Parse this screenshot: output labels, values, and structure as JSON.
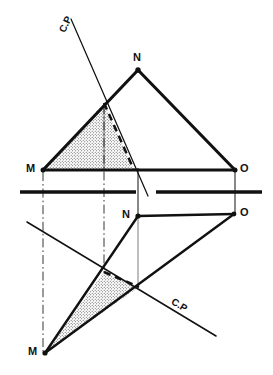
{
  "figure": {
    "type": "engineering-drawing",
    "background_color": "#ffffff",
    "line_color": "#111111",
    "stipple_color": "#4a4a4a"
  },
  "ground_line": {
    "name": "ground-line",
    "y": 192,
    "x_start": 20,
    "x_end": 262,
    "gap_start": 136,
    "gap_end": 156,
    "stroke_width": 3.2
  },
  "front_view": {
    "label": "front-view",
    "vertices": [
      {
        "name": "M",
        "label": "M",
        "x": 43,
        "y": 170,
        "label_x": 26,
        "label_y": 163,
        "dot": true
      },
      {
        "name": "N",
        "label": "N",
        "x": 138,
        "y": 70,
        "label_x": 133,
        "label_y": 52,
        "dot": true
      },
      {
        "name": "O",
        "label": "O",
        "x": 235,
        "y": 170,
        "label_x": 240,
        "label_y": 163,
        "dot": true
      }
    ],
    "edges": [
      {
        "name": "edge-MN",
        "from": "M",
        "to": "N"
      },
      {
        "name": "edge-NO",
        "from": "N",
        "to": "O"
      },
      {
        "name": "edge-MO",
        "from": "M",
        "to": "O"
      }
    ],
    "cut_line": {
      "name": "cutting-plane-line-front",
      "x1": 71,
      "y1": 19,
      "x2": 148,
      "y2": 196,
      "stroke_width": 1.2,
      "label": "C.P",
      "label_x": 62,
      "label_y": 27,
      "label_rotation": -64
    },
    "cut_intersections": [
      {
        "name": "cut-point-on-MN",
        "x": 104,
        "y": 103
      },
      {
        "name": "cut-point-on-MO",
        "x": 134,
        "y": 170
      }
    ],
    "hidden_edge": {
      "name": "hidden-cut-edge-front",
      "x1": 104,
      "y1": 103,
      "x2": 134,
      "y2": 170,
      "dash": "7,5",
      "stroke_width": 2.4
    },
    "stippled_region": {
      "name": "cut-section-front",
      "points": "43,170 104,103 134,170"
    },
    "projector_thin": {
      "name": "projector-thin-front",
      "x": 104,
      "y1": 103,
      "y2": 170
    }
  },
  "top_view": {
    "label": "top-view",
    "vertices": [
      {
        "name": "M-prime",
        "label": "M",
        "x": 45,
        "y": 353,
        "label_x": 28,
        "label_y": 346,
        "dot": true
      },
      {
        "name": "N-prime",
        "label": "N",
        "x": 138,
        "y": 216,
        "label_x": 122,
        "label_y": 209,
        "dot": true
      },
      {
        "name": "O-prime",
        "label": "O",
        "x": 234,
        "y": 214,
        "label_x": 240,
        "label_y": 207,
        "dot": true
      }
    ],
    "edges": [
      {
        "name": "edge-MN-prime",
        "from": "M-prime",
        "to": "N-prime"
      },
      {
        "name": "edge-NO-prime",
        "from": "N-prime",
        "to": "O-prime"
      },
      {
        "name": "edge-MO-prime",
        "from": "M-prime",
        "to": "O-prime"
      }
    ],
    "cut_line": {
      "name": "cutting-plane-line-top",
      "x1": 27,
      "y1": 222,
      "x2": 216,
      "y2": 336,
      "stroke_width": 1.4,
      "label": "C.P",
      "label_x": 172,
      "label_y": 296,
      "label_rotation": 31
    },
    "cut_intersections": [
      {
        "name": "cut-point-on-MN-prime",
        "x": 104,
        "y": 272
      },
      {
        "name": "cut-point-on-MO-prime",
        "x": 139,
        "y": 287
      }
    ],
    "hidden_edge": {
      "name": "hidden-cut-edge-top",
      "x1": 104,
      "y1": 272,
      "x2": 139,
      "y2": 287,
      "dash": "7,5",
      "stroke_width": 2.4
    },
    "stippled_region": {
      "name": "cut-section-top",
      "points": "45,353 104,272 139,287"
    },
    "projector_thin": {
      "name": "projector-thin-top",
      "x": 138,
      "y1": 216,
      "y2": 288
    }
  },
  "projectors": [
    {
      "name": "projector-M",
      "x": 43,
      "y1": 170,
      "y2": 353,
      "style": "dash-dot"
    },
    {
      "name": "projector-cut",
      "x": 104,
      "y1": 103,
      "y2": 273,
      "style": "dash-dot"
    },
    {
      "name": "projector-N",
      "x": 138,
      "y1": 170,
      "y2": 216,
      "style": "solid-thin"
    },
    {
      "name": "projector-O",
      "x": 235,
      "y1": 170,
      "y2": 214,
      "style": "solid-thin"
    }
  ],
  "labels": {
    "cutting_plane": "C.P",
    "vertex_m": "M",
    "vertex_n": "N",
    "vertex_o": "O"
  }
}
